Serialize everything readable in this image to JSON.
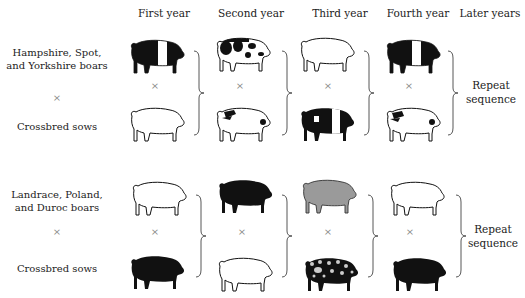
{
  "headers": [
    "First year",
    "Second year",
    "Third year",
    "Fourth year",
    "Later years"
  ],
  "systems": [
    {
      "boar_label": "Hampshire, Spot, and Yorkshire boars",
      "cross_symbol": "×",
      "sow_label": "Crossbred sows",
      "repeat_label_line1": "Repeat",
      "repeat_label_line2": "sequence",
      "pigs": [
        {
          "year": "First year",
          "boar": "hampshire-belted-black",
          "sow": "white-outline"
        },
        {
          "year": "Second year",
          "boar": "spotted-black-on-white",
          "sow": "white-with-black-spots"
        },
        {
          "year": "Third year",
          "boar": "white-outline",
          "sow": "hampshire-belted-black"
        },
        {
          "year": "Fourth year",
          "boar": "hampshire-belted-black",
          "sow": "white-with-black-spots"
        }
      ]
    },
    {
      "boar_label": "Landrace, Poland, and Duroc boars",
      "cross_symbol": "×",
      "sow_label": "Crossbred sows",
      "repeat_label_line1": "Repeat",
      "repeat_label_line2": "sequence",
      "pigs": [
        {
          "year": "First year",
          "boar": "white-outline",
          "sow": "solid-black"
        },
        {
          "year": "Second year",
          "boar": "solid-black",
          "sow": "white-outline"
        },
        {
          "year": "Third year",
          "boar": "solid-gray",
          "sow": "black-with-white-spots"
        },
        {
          "year": "Fourth year",
          "boar": "white-outline",
          "sow": "solid-black"
        }
      ]
    }
  ],
  "colors": {
    "black": "#111111",
    "gray": "#9a9a9a",
    "white": "#ffffff",
    "text": "#222222",
    "cross": "#888888"
  }
}
